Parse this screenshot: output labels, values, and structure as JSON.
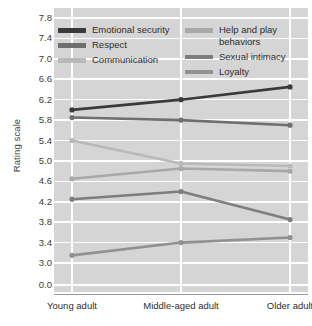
{
  "chart_data": {
    "type": "line",
    "title": "",
    "xlabel": "",
    "ylabel": "Rating scale",
    "categories": [
      "Young adult",
      "Middle-aged adult",
      "Older adult"
    ],
    "ylim": [
      3.0,
      7.8
    ],
    "y_ticks": [
      "7.8",
      "7.4",
      "7.0",
      "6.6",
      "6.2",
      "5.8",
      "5.4",
      "5.0",
      "4.6",
      "4.2",
      "3.8",
      "3.4",
      "3.0",
      "0.0"
    ],
    "y_tick_values": [
      7.8,
      7.4,
      7.0,
      6.6,
      6.2,
      5.8,
      5.4,
      5.0,
      4.6,
      4.2,
      3.8,
      3.4,
      3.0,
      0.0
    ],
    "axis_break": true,
    "grid": true,
    "legend_position": "top-inside",
    "series": [
      {
        "name": "Emotional security",
        "values": [
          6.0,
          6.2,
          6.45
        ],
        "color": "#3a3a3a"
      },
      {
        "name": "Respect",
        "values": [
          5.85,
          5.8,
          5.7
        ],
        "color": "#6f6f6f"
      },
      {
        "name": "Communication",
        "values": [
          5.4,
          4.95,
          4.9
        ],
        "color": "#b9b9b9"
      },
      {
        "name": "Help and play\nbehaviors",
        "values": [
          4.65,
          4.85,
          4.8
        ],
        "color": "#a8a8a8"
      },
      {
        "name": "Sexual intimacy",
        "values": [
          4.25,
          4.4,
          3.85
        ],
        "color": "#7e7e7e"
      },
      {
        "name": "Loyalty",
        "values": [
          3.15,
          3.4,
          3.5
        ],
        "color": "#919191"
      }
    ],
    "colors": {
      "panel_background": "#d5d5d5",
      "gridline": "#ffffff",
      "axis": "#9a9a9a",
      "text": "#2e2e2e"
    }
  },
  "legend": {
    "left_column": [
      {
        "label": "Emotional security",
        "color": "#3a3a3a"
      },
      {
        "label": "Respect",
        "color": "#6f6f6f"
      },
      {
        "label": "Communication",
        "color": "#b9b9b9"
      }
    ],
    "right_column": [
      {
        "label": "Help and play\nbehaviors",
        "color": "#a8a8a8"
      },
      {
        "label": "Sexual intimacy",
        "color": "#7e7e7e"
      },
      {
        "label": "Loyalty",
        "color": "#919191"
      }
    ]
  }
}
